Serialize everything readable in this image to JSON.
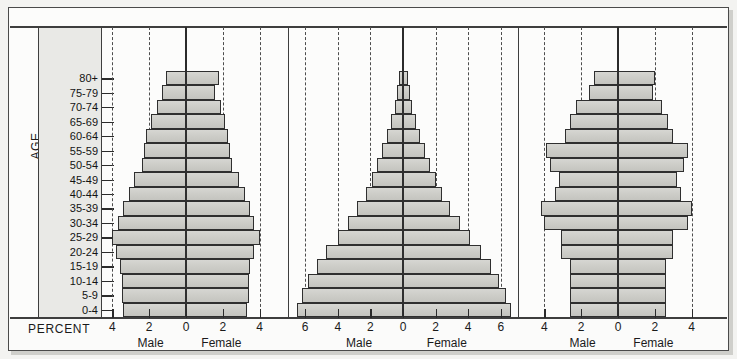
{
  "figure": {
    "axis_title_age": "AGE",
    "axis_title_percent": "PERCENT",
    "male_label": "Male",
    "female_label": "Female",
    "bar_fill": "#cdcdc8",
    "bar_stroke": "#2f2f2f",
    "gridline_color": "#4d4d4d",
    "frame_color": "#3e3e3e",
    "panel_background": "#fcfcfb"
  },
  "age_groups": [
    "80+",
    "75-79",
    "70-74",
    "65-69",
    "60-64",
    "55-59",
    "50-54",
    "45-49",
    "40-44",
    "35-39",
    "30-34",
    "25-29",
    "20-24",
    "15-19",
    "10-14",
    "5-9",
    "0-4"
  ],
  "chart_data": [
    {
      "type": "bar",
      "subtype": "population-pyramid",
      "title": "",
      "xlabel": "PERCENT",
      "ylabel": "AGE",
      "xlim": [
        -5,
        5
      ],
      "xticks": [
        4,
        2,
        0,
        2,
        4
      ],
      "xtick_values": [
        -4,
        -2,
        0,
        2,
        4
      ],
      "grid": "dashed vertical at -4, -2, 2, 4; solid at 0",
      "legend": [
        "Male",
        "Female"
      ],
      "categories": [
        "80+",
        "75-79",
        "70-74",
        "65-69",
        "60-64",
        "55-59",
        "50-54",
        "45-49",
        "40-44",
        "35-39",
        "30-34",
        "25-29",
        "20-24",
        "15-19",
        "10-14",
        "5-9",
        "0-4"
      ],
      "series": [
        {
          "name": "Male",
          "values": [
            1.1,
            1.3,
            1.6,
            1.9,
            2.2,
            2.3,
            2.4,
            2.8,
            3.1,
            3.4,
            3.7,
            4.0,
            3.8,
            3.6,
            3.5,
            3.5,
            3.4
          ]
        },
        {
          "name": "Female",
          "values": [
            1.8,
            1.6,
            1.9,
            2.1,
            2.3,
            2.4,
            2.5,
            2.9,
            3.2,
            3.5,
            3.7,
            4.0,
            3.7,
            3.5,
            3.4,
            3.4,
            3.3
          ]
        }
      ]
    },
    {
      "type": "bar",
      "subtype": "population-pyramid",
      "title": "",
      "xlabel": "PERCENT",
      "ylabel": "AGE",
      "xlim": [
        -7,
        7
      ],
      "xticks": [
        6,
        4,
        2,
        0,
        2,
        4,
        6
      ],
      "xtick_values": [
        -6,
        -4,
        -2,
        0,
        2,
        4,
        6
      ],
      "grid": "dashed vertical at -6, -4, -2, 2, 4, 6; solid at 0",
      "legend": [
        "Male",
        "Female"
      ],
      "categories": [
        "80+",
        "75-79",
        "70-74",
        "65-69",
        "60-64",
        "55-59",
        "50-54",
        "45-49",
        "40-44",
        "35-39",
        "30-34",
        "25-29",
        "20-24",
        "15-19",
        "10-14",
        "5-9",
        "0-4"
      ],
      "series": [
        {
          "name": "Male",
          "values": [
            0.25,
            0.35,
            0.5,
            0.75,
            1.0,
            1.3,
            1.6,
            1.9,
            2.3,
            2.8,
            3.4,
            4.0,
            4.7,
            5.3,
            5.8,
            6.2,
            6.5
          ]
        },
        {
          "name": "Female",
          "values": [
            0.3,
            0.4,
            0.55,
            0.8,
            1.05,
            1.35,
            1.65,
            2.0,
            2.4,
            2.9,
            3.5,
            4.1,
            4.8,
            5.4,
            5.9,
            6.3,
            6.6
          ]
        }
      ]
    },
    {
      "type": "bar",
      "subtype": "population-pyramid",
      "title": "",
      "xlabel": "PERCENT",
      "ylabel": "AGE",
      "xlim": [
        -5,
        5
      ],
      "xticks": [
        4,
        2,
        0,
        2,
        4
      ],
      "xtick_values": [
        -4,
        -2,
        0,
        2,
        4
      ],
      "grid": "dashed vertical at -4, -2, 2, 4; solid at 0",
      "legend": [
        "Male",
        "Female"
      ],
      "categories": [
        "80+",
        "75-79",
        "70-74",
        "65-69",
        "60-64",
        "55-59",
        "50-54",
        "45-49",
        "40-44",
        "35-39",
        "30-34",
        "25-29",
        "20-24",
        "15-19",
        "10-14",
        "5-9",
        "0-4"
      ],
      "series": [
        {
          "name": "Male",
          "values": [
            1.3,
            1.6,
            2.3,
            2.6,
            2.9,
            3.9,
            3.7,
            3.2,
            3.4,
            4.2,
            4.0,
            3.1,
            3.1,
            2.6,
            2.6,
            2.6,
            2.6
          ]
        },
        {
          "name": "Female",
          "values": [
            2.0,
            1.9,
            2.4,
            2.7,
            3.0,
            3.8,
            3.6,
            3.2,
            3.4,
            4.0,
            3.8,
            3.0,
            3.0,
            2.6,
            2.6,
            2.6,
            2.6
          ]
        }
      ]
    }
  ]
}
